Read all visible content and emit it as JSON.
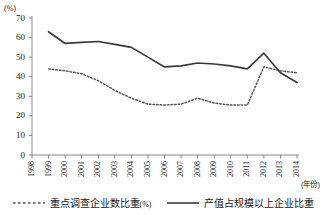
{
  "chart_data": {
    "type": "line",
    "title": "",
    "xlabel": "(年份)",
    "ylabel": "(%)",
    "ylim": [
      0,
      70
    ],
    "ytick_step": 10,
    "yticks": [
      "0",
      "10",
      "20",
      "30",
      "40",
      "50",
      "60",
      "70"
    ],
    "grid": false,
    "legend_position": "bottom",
    "categories": [
      "1998",
      "1999",
      "2000",
      "2001",
      "2002",
      "2003",
      "2004",
      "2005",
      "2006",
      "2007",
      "2008",
      "2009",
      "2010",
      "2011",
      "2012",
      "2013",
      "2014"
    ],
    "series": [
      {
        "name": "重点调查企业数比重(%)",
        "style": "dotted",
        "color": "#555555",
        "values": [
          null,
          44,
          43,
          41.5,
          38,
          33,
          29,
          26,
          25.5,
          26,
          29,
          26.5,
          25.5,
          25.5,
          45,
          43,
          42
        ]
      },
      {
        "name": "产值占规模以上企业比重",
        "style": "solid",
        "color": "#3a3a3a",
        "values": [
          null,
          63,
          57,
          57.5,
          58,
          56.5,
          55,
          50,
          45,
          45.5,
          47,
          46.5,
          45.5,
          44,
          52,
          42,
          37
        ]
      }
    ]
  },
  "axes": {
    "unit_label": "(%)",
    "x_axis_title": "(年份)"
  },
  "legend": {
    "items": [
      {
        "label": "重点调查企业数比重",
        "suffix": "(%)",
        "style": "dotted"
      },
      {
        "label": "产值占规模以上企业比重",
        "suffix": "",
        "style": "solid"
      }
    ]
  },
  "colors": {
    "axis": "#7a7a7a",
    "solid_series": "#3a3a3a",
    "dotted_series": "#555555",
    "text": "#1a1a1a",
    "background": "#ffffff"
  }
}
